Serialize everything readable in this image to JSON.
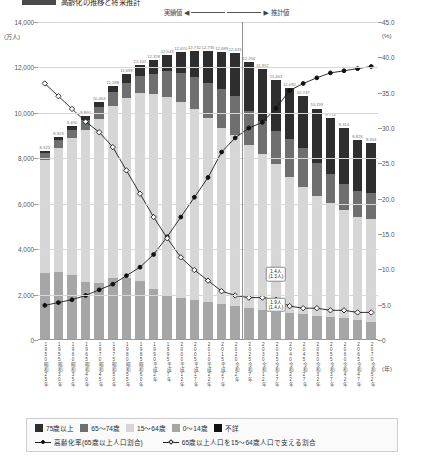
{
  "title": {
    "tag": "",
    "text": "高齢化の推移と将来推計"
  },
  "axes": {
    "left_unit": "(万人)",
    "right_unit": "(%)",
    "x_unit": "(年)",
    "left_ticks": [
      "14,000",
      "12,000",
      "10,000",
      "8,000",
      "6,000",
      "4,000",
      "2,000",
      "0"
    ],
    "right_ticks": [
      "45.0",
      "40.0",
      "35.0",
      "30.0",
      "25.0",
      "20.0",
      "15.0",
      "10.0",
      "5.0",
      "0"
    ]
  },
  "annotations": {
    "actual": "実績値",
    "estimate": "推計値",
    "callouts": [
      {
        "line1": "1.4人",
        "line2": "(1.3人)"
      },
      {
        "line1": "1.9人",
        "line2": "(1.4人)"
      }
    ]
  },
  "legend": {
    "boxes": [
      {
        "label": "75歳以上",
        "color": "#2e2e2e"
      },
      {
        "label": "65〜74歳",
        "color": "#6f6f6f"
      },
      {
        "label": "15〜64歳",
        "color": "#d6d6d6"
      },
      {
        "label": "0〜14歳",
        "color": "#a6a6a6"
      },
      {
        "label": "不詳",
        "color": "#111111"
      }
    ],
    "lines": [
      {
        "label": "高齢化率(65歳以上人口割合)",
        "marker": "filled-circle"
      },
      {
        "label": "65歳以上人口を15〜64歳人口で支える割合",
        "marker": "hollow-diamond"
      }
    ]
  },
  "chart_data": {
    "type": "bar",
    "title": "高齢化の推移と将来推計",
    "xlabel": "(年)",
    "ylabel": "(万人)",
    "y2label": "(%)",
    "ylim": [
      0,
      14000
    ],
    "y2lim": [
      0,
      45
    ],
    "grid": true,
    "legend_position": "bottom",
    "forecast_start_index": 15,
    "categories": [
      "1950",
      "1955",
      "1960",
      "1965",
      "1970",
      "1975",
      "1980",
      "1985",
      "1990",
      "1995",
      "2000",
      "2005",
      "2010",
      "2015",
      "2020",
      "2025",
      "2030",
      "2035",
      "2040",
      "2045",
      "2050",
      "2055",
      "2060",
      "2065",
      "2070"
    ],
    "era_labels": [
      "昭和25年",
      "昭和30年",
      "昭和35年",
      "昭和40年",
      "昭和45年",
      "昭和50年",
      "昭和55年",
      "昭和60年",
      "平成2年",
      "平成7年",
      "平成12年",
      "平成17年",
      "平成22年",
      "平成27年",
      "令和2年",
      "令和7年",
      "令和12年",
      "令和17年",
      "令和22年",
      "令和27年",
      "令和32年",
      "令和37年",
      "令和42年",
      "令和47年",
      "令和52年"
    ],
    "series": [
      {
        "name": "0〜14歳",
        "values": [
          2943,
          2980,
          2843,
          2553,
          2515,
          2722,
          2751,
          2603,
          2249,
          2001,
          1847,
          1752,
          1684,
          1595,
          1503,
          1407,
          1321,
          1246,
          1194,
          1138,
          1077,
          1012,
          951,
          898,
          797
        ]
      },
      {
        "name": "15〜64歳",
        "values": [
          4966,
          5473,
          6047,
          6693,
          7212,
          7581,
          7883,
          8251,
          8590,
          8716,
          8622,
          8409,
          8103,
          7728,
          7509,
          7170,
          6875,
          6494,
          5978,
          5584,
          5275,
          5028,
          4793,
          4529,
          4535
        ]
      },
      {
        "name": "65〜74歳",
        "values": [
          309,
          338,
          376,
          425,
          516,
          601,
          699,
          776,
          892,
          1109,
          1301,
          1407,
          1529,
          1734,
          1747,
          1497,
          1428,
          1443,
          1681,
          1748,
          1424,
          1288,
          1133,
          1133,
          1142
        ]
      },
      {
        "name": "75歳以上",
        "values": [
          107,
          132,
          164,
          189,
          221,
          284,
          366,
          471,
          597,
          717,
          900,
          1164,
          1419,
          1632,
          1872,
          2180,
          2288,
          2260,
          2239,
          2277,
          2417,
          2446,
          2437,
          2266,
          2180
        ]
      },
      {
        "name": "不詳",
        "values": [
          0,
          0,
          0,
          0,
          0,
          0,
          0,
          0,
          0,
          0,
          0,
          0,
          0,
          0,
          0,
          0,
          0,
          0,
          0,
          0,
          0,
          0,
          0,
          0,
          0
        ]
      }
    ],
    "lines": [
      {
        "name": "高齢化率(65歳以上人口割合)",
        "unit": "%",
        "axis": "right",
        "marker": "filled-circle",
        "values": [
          4.9,
          5.3,
          5.7,
          6.3,
          7.1,
          7.9,
          9.1,
          10.3,
          12.1,
          14.6,
          17.4,
          20.2,
          23.0,
          26.6,
          28.6,
          30.0,
          30.8,
          32.8,
          35.3,
          36.3,
          37.1,
          37.8,
          38.1,
          38.4,
          38.7
        ]
      },
      {
        "name": "65歳以上人口を15〜64歳人口で支える割合",
        "unit": "人",
        "axis": "right",
        "marker": "hollow-diamond",
        "values": [
          12.1,
          11.5,
          10.9,
          10.3,
          9.8,
          9.1,
          8.0,
          6.9,
          5.8,
          4.8,
          3.9,
          3.3,
          2.8,
          2.3,
          2.1,
          2.0,
          2.0,
          1.9,
          1.6,
          1.5,
          1.5,
          1.4,
          1.4,
          1.3,
          1.3
        ]
      }
    ]
  }
}
